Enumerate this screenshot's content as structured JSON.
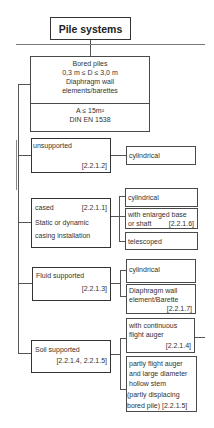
{
  "title": "Pile systems",
  "root": {
    "lines": [
      "Bored piles",
      "0,3 m ≤ D ≤ 3,0 m",
      "Diaphragm wall",
      "elements/barettes"
    ],
    "sub_lines": [
      "A ≤ 15m²",
      "DIN EN 1538"
    ]
  },
  "categories": [
    {
      "label": "unsupported",
      "ref": "[2.2.1.2]",
      "children": [
        {
          "lines": [
            "cylindrical"
          ]
        }
      ]
    },
    {
      "label": "cased",
      "ref": "[2.2.1.1]",
      "extra": [
        "Static or dynamic",
        "casing installation"
      ],
      "children": [
        {
          "lines": [
            "cylindrical"
          ]
        },
        {
          "lines": [
            "with enlarged base",
            "or shaft"
          ],
          "ref": "[2.2.1.6]"
        },
        {
          "lines": [
            "telescoped"
          ]
        }
      ]
    },
    {
      "label": "Fluid supported",
      "ref": "[2.2.1.3]",
      "children": [
        {
          "lines": [
            "cylindrical"
          ]
        },
        {
          "lines": [
            "Diaphragm wall",
            "element/Barette"
          ],
          "ref": "[2.2.1.7]"
        }
      ]
    },
    {
      "label": "Soil supported",
      "ref": "[2.2.1.4, 2.2.1.5]",
      "children": [
        {
          "lines": [
            "with continuous",
            "flight auger"
          ],
          "ref": "[2.2.1.4]"
        },
        {
          "lines": [
            "partly flight auger",
            "and large diameter",
            "hollow stem",
            "(partly  displacing",
            "bored pile) [2.2.1.5]"
          ]
        }
      ]
    }
  ]
}
